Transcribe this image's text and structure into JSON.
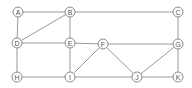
{
  "graph": {
    "nodes": [
      {
        "id": "A",
        "x": 18,
        "y": 12
      },
      {
        "id": "B",
        "x": 70,
        "y": 12
      },
      {
        "id": "C",
        "x": 178,
        "y": 12
      },
      {
        "id": "D",
        "x": 17,
        "y": 43
      },
      {
        "id": "E",
        "x": 70,
        "y": 43
      },
      {
        "id": "F",
        "x": 103,
        "y": 44
      },
      {
        "id": "G",
        "x": 178,
        "y": 44
      },
      {
        "id": "H",
        "x": 17,
        "y": 77
      },
      {
        "id": "I",
        "x": 70,
        "y": 77
      },
      {
        "id": "J",
        "x": 137,
        "y": 77
      },
      {
        "id": "K",
        "x": 178,
        "y": 77
      }
    ],
    "edges": [
      [
        "A",
        "B"
      ],
      [
        "A",
        "D"
      ],
      [
        "B",
        "D"
      ],
      [
        "B",
        "C"
      ],
      [
        "B",
        "E"
      ],
      [
        "C",
        "G"
      ],
      [
        "D",
        "E"
      ],
      [
        "D",
        "H"
      ],
      [
        "E",
        "F"
      ],
      [
        "E",
        "I"
      ],
      [
        "F",
        "G"
      ],
      [
        "F",
        "I"
      ],
      [
        "F",
        "J"
      ],
      [
        "G",
        "J"
      ],
      [
        "G",
        "K"
      ],
      [
        "H",
        "I"
      ],
      [
        "I",
        "J"
      ],
      [
        "J",
        "K"
      ]
    ]
  }
}
